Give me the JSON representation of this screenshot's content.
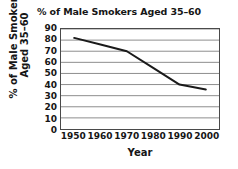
{
  "chart_data": {
    "type": "line",
    "title": "% of Male Smokers Aged 35–60",
    "xlabel": "Year",
    "ylabel": "% of Male Smokers Aged 35–60",
    "ylabel_lines": [
      "% of Male Smokers",
      "Aged 35–60"
    ],
    "x": [
      1950,
      1960,
      1970,
      1980,
      1990,
      2000
    ],
    "values": [
      82,
      76,
      70,
      55,
      40,
      35.5
    ],
    "xtick_labels": [
      "1950",
      "1960",
      "1970",
      "1980",
      "1990",
      "2000"
    ],
    "ytick_labels": [
      "90",
      "80",
      "70",
      "60",
      "50",
      "40",
      "30",
      "20",
      "10",
      "0"
    ],
    "ytick_values": [
      90,
      80,
      70,
      60,
      50,
      40,
      30,
      20,
      10,
      0
    ],
    "xlim": [
      1945,
      2005
    ],
    "ylim": [
      0,
      90
    ],
    "grid": "horizontal",
    "legend": "none",
    "line_color": "#1a1a1a",
    "grid_color": "#8c8c8c",
    "frame_color": "#4a4a4a",
    "background_color": "#ffffff"
  }
}
